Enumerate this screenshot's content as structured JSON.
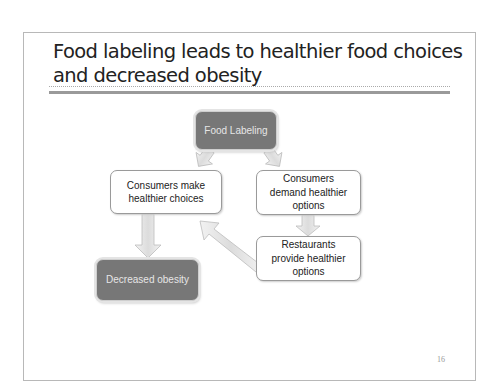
{
  "slide": {
    "title": "Food labeling leads to healthier food choices and decreased obesity",
    "page_number": "16",
    "diagram": {
      "nodes": [
        {
          "id": "food-labeling",
          "label": "Food Labeling",
          "style": "dark"
        },
        {
          "id": "consumers-make",
          "label": "Consumers make healthier choices",
          "style": "light"
        },
        {
          "id": "consumers-demand",
          "label": "Consumers demand healthier options",
          "style": "light"
        },
        {
          "id": "restaurants-provide",
          "label": "Restaurants provide healthier options",
          "style": "light"
        },
        {
          "id": "decreased-obesity",
          "label": "Decreased obesity",
          "style": "dark"
        }
      ],
      "edges": [
        {
          "from": "food-labeling",
          "to": "consumers-make"
        },
        {
          "from": "food-labeling",
          "to": "consumers-demand"
        },
        {
          "from": "consumers-demand",
          "to": "restaurants-provide"
        },
        {
          "from": "restaurants-provide",
          "to": "consumers-make"
        },
        {
          "from": "consumers-make",
          "to": "decreased-obesity"
        }
      ]
    },
    "colors": {
      "dark_box": "#777777",
      "arrow_fill": "#e8e8e8",
      "border": "#b8b8b8"
    }
  }
}
